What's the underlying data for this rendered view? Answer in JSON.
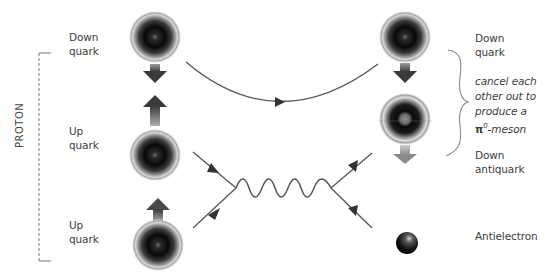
{
  "diagram": {
    "group_label": "PROTON",
    "left_particles": [
      {
        "line1": "Down",
        "line2": "quark",
        "spin": "down"
      },
      {
        "line1": "Up",
        "line2": "quark",
        "spin": "up"
      },
      {
        "line1": "Up",
        "line2": "quark",
        "spin": "up"
      }
    ],
    "right_particles": [
      {
        "line1": "Down",
        "line2": "quark",
        "spin": "down"
      },
      {
        "line1": "Down",
        "line2": "antiquark",
        "spin": "down"
      },
      {
        "line1": "Antielectron",
        "line2": ""
      }
    ],
    "annotation": {
      "lines": [
        "cancel each",
        "other out to",
        "produce a"
      ],
      "pi_symbol": "π",
      "pi_superscript": "0",
      "pi_suffix": "-meson"
    },
    "interaction": "W-boson exchange (wavy line) between two vertices",
    "colors": {
      "line": "#555555",
      "arrow": "#4a4a4a",
      "text": "#3c3c3c"
    }
  }
}
